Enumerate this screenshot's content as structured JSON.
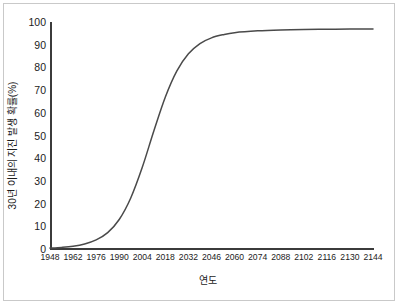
{
  "chart_data": {
    "type": "line",
    "title": "",
    "xlabel": "연도",
    "ylabel": "30년 이내의 지진 발생 확률(%)",
    "xlim": [
      1948,
      2144
    ],
    "ylim": [
      0,
      100
    ],
    "grid": false,
    "legend": null,
    "line_color": "#4a4a4a",
    "x_tick_labels": [
      "1948",
      "1962",
      "1976",
      "1990",
      "2004",
      "2018",
      "2032",
      "2046",
      "2060",
      "2074",
      "2088",
      "2102",
      "2116",
      "2130",
      "2144"
    ],
    "y_tick_labels": [
      "100",
      "90",
      "80",
      "70",
      "60",
      "50",
      "40",
      "30",
      "20",
      "10",
      "0"
    ],
    "x": [
      1948,
      1955,
      1962,
      1969,
      1976,
      1983,
      1990,
      1997,
      2004,
      2011,
      2018,
      2025,
      2032,
      2039,
      2046,
      2053,
      2060,
      2074,
      2088,
      2102,
      2116,
      2130,
      2144
    ],
    "y": [
      0.4,
      0.7,
      1.2,
      2.2,
      4.0,
      7.2,
      13.0,
      22.5,
      36.0,
      52.0,
      67.0,
      78.5,
      86.0,
      90.5,
      93.0,
      94.4,
      95.3,
      96.1,
      96.5,
      96.7,
      96.8,
      96.9,
      96.9
    ],
    "series": [
      {
        "name": "지진 발생 확률",
        "values": [
          0.4,
          0.7,
          1.2,
          2.2,
          4.0,
          7.2,
          13.0,
          22.5,
          36.0,
          52.0,
          67.0,
          78.5,
          86.0,
          90.5,
          93.0,
          94.4,
          95.3,
          96.1,
          96.5,
          96.7,
          96.8,
          96.9,
          96.9
        ]
      }
    ]
  }
}
